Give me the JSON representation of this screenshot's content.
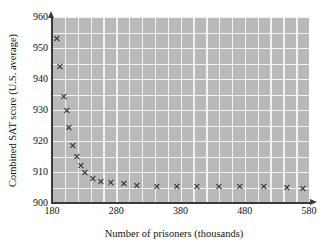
{
  "chart_data": {
    "type": "scatter",
    "title": "",
    "xlabel": "Number of prisoners (thousands)",
    "ylabel": "Combined SAT score (U.S. average)",
    "xlim": [
      180,
      580
    ],
    "ylim": [
      900,
      960
    ],
    "xticks": [
      180,
      280,
      380,
      480,
      580
    ],
    "yticks": [
      900,
      910,
      920,
      930,
      940,
      950,
      960
    ],
    "grid": true,
    "grid_x_step": 20,
    "grid_y_step": 5,
    "legend": null,
    "marker": "x",
    "marker_color": "#2b2b2b",
    "plot_background": "#b9b9b9",
    "grid_color": "#f2f2f2",
    "axis_color": "#3a3a3a",
    "points": [
      {
        "x": 188,
        "y": 953.0
      },
      {
        "x": 193,
        "y": 944.0
      },
      {
        "x": 199,
        "y": 934.5
      },
      {
        "x": 203,
        "y": 930.0
      },
      {
        "x": 207,
        "y": 924.5
      },
      {
        "x": 213,
        "y": 918.5
      },
      {
        "x": 219,
        "y": 915.0
      },
      {
        "x": 225,
        "y": 912.0
      },
      {
        "x": 232,
        "y": 909.8
      },
      {
        "x": 244,
        "y": 908.0
      },
      {
        "x": 256,
        "y": 907.0
      },
      {
        "x": 272,
        "y": 906.5
      },
      {
        "x": 292,
        "y": 906.3
      },
      {
        "x": 312,
        "y": 905.6
      },
      {
        "x": 343,
        "y": 905.4
      },
      {
        "x": 375,
        "y": 905.2
      },
      {
        "x": 406,
        "y": 905.2
      },
      {
        "x": 440,
        "y": 905.2
      },
      {
        "x": 473,
        "y": 905.2
      },
      {
        "x": 510,
        "y": 905.2
      },
      {
        "x": 545,
        "y": 905.0
      },
      {
        "x": 571,
        "y": 904.7
      }
    ]
  },
  "axis": {
    "x_title": "Number of prisoners (thousands)",
    "y_title": "Combined SAT score (U.S. average)",
    "x_tick_labels": [
      "180",
      "280",
      "380",
      "480",
      "580"
    ],
    "y_tick_labels": [
      "900",
      "910",
      "920",
      "930",
      "940",
      "950",
      "960"
    ]
  }
}
